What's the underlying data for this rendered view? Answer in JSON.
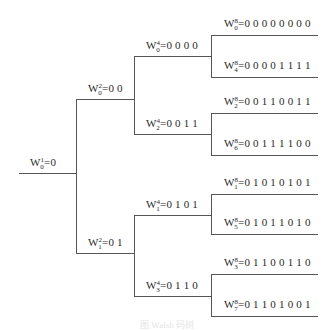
{
  "diagram": {
    "type": "walsh-code-tree",
    "root": {
      "w": "W",
      "sup": "1",
      "sub": "0",
      "value": "=0"
    },
    "level2": [
      {
        "w": "W",
        "sup": "2",
        "sub": "0",
        "value": "=0 0"
      },
      {
        "w": "W",
        "sup": "2",
        "sub": "1",
        "value": "=0 1"
      }
    ],
    "level4": [
      {
        "w": "W",
        "sup": "4",
        "sub": "0",
        "value": "=0 0 0 0"
      },
      {
        "w": "W",
        "sup": "4",
        "sub": "2",
        "value": "=0 0 1 1"
      },
      {
        "w": "W",
        "sup": "4",
        "sub": "1",
        "value": "=0 1 0 1"
      },
      {
        "w": "W",
        "sup": "4",
        "sub": "3",
        "value": "=0 1 1 0"
      }
    ],
    "level8": [
      {
        "w": "W",
        "sup": "8",
        "sub": "0",
        "value": "=0 0 0 0 0 0 0 0"
      },
      {
        "w": "W",
        "sup": "8",
        "sub": "4",
        "value": "=0 0 0 0 1 1 1 1"
      },
      {
        "w": "W",
        "sup": "8",
        "sub": "2",
        "value": "=0 0 1 1 0 0 1 1"
      },
      {
        "w": "W",
        "sup": "8",
        "sub": "6",
        "value": "=0 0 1 1 1 1 0 0"
      },
      {
        "w": "W",
        "sup": "8",
        "sub": "1",
        "value": "=0 1 0 1 0 1 0 1"
      },
      {
        "w": "W",
        "sup": "8",
        "sub": "5",
        "value": "=0 1 0 1 1 0 1 0"
      },
      {
        "w": "W",
        "sup": "8",
        "sub": "3",
        "value": "=0 1 1 0 0 1 1 0"
      },
      {
        "w": "W",
        "sup": "8",
        "sub": "7",
        "value": "=0 1 1 0 1 0 0 1"
      }
    ],
    "caption": "图 Walsh 码树"
  }
}
